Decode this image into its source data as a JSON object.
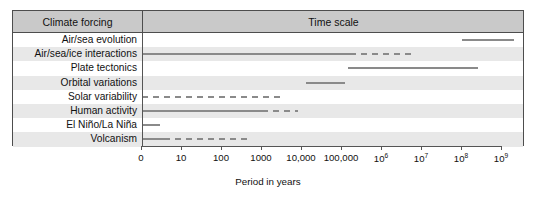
{
  "chart_data": {
    "type": "bar",
    "title": "",
    "xlabel": "Period in years",
    "ylabel": "Climate forcing",
    "xscale": "log",
    "grid": false,
    "legend": null,
    "columns": [
      "Climate forcing",
      "Time scale"
    ],
    "tick_labels": [
      "0",
      "10",
      "100",
      "1000",
      "10,000",
      "100,000",
      "10",
      "10",
      "10",
      "10"
    ],
    "tick_exponents": [
      "",
      "",
      "",
      "",
      "",
      "",
      "6",
      "7",
      "8",
      "9"
    ],
    "tick_decades": [
      0,
      1,
      2,
      3,
      4,
      5,
      6,
      7,
      8,
      9
    ],
    "categories": [
      "Air/sea evolution",
      "Air/sea/ice interactions",
      "Plate tectonics",
      "Orbital variations",
      "Solar variability",
      "Human activity",
      "El Niño/La Niña",
      "Volcanism"
    ],
    "series": [
      {
        "name": "Air/sea evolution",
        "segments": [
          {
            "start_decade": 8.0,
            "end_decade": 9.3,
            "style": "solid"
          }
        ]
      },
      {
        "name": "Air/sea/ice interactions",
        "segments": [
          {
            "start_decade": 0.0,
            "end_decade": 5.2,
            "style": "solid"
          },
          {
            "start_decade": 5.2,
            "end_decade": 6.75,
            "style": "dashed"
          }
        ]
      },
      {
        "name": "Plate tectonics",
        "segments": [
          {
            "start_decade": 5.15,
            "end_decade": 8.4,
            "style": "solid"
          }
        ]
      },
      {
        "name": "Orbital variations",
        "segments": [
          {
            "start_decade": 4.1,
            "end_decade": 5.08,
            "style": "solid"
          }
        ]
      },
      {
        "name": "Solar variability",
        "segments": [
          {
            "start_decade": 0.0,
            "end_decade": 3.58,
            "style": "dashed"
          }
        ]
      },
      {
        "name": "Human activity",
        "segments": [
          {
            "start_decade": 0.0,
            "end_decade": 3.0,
            "style": "solid"
          },
          {
            "start_decade": 3.0,
            "end_decade": 3.9,
            "style": "dashed"
          }
        ]
      },
      {
        "name": "El Niño/La Niña",
        "segments": [
          {
            "start_decade": 0.0,
            "end_decade": 0.45,
            "style": "solid"
          }
        ]
      },
      {
        "name": "Volcanism",
        "segments": [
          {
            "start_decade": 0.0,
            "end_decade": 0.55,
            "style": "solid"
          },
          {
            "start_decade": 0.55,
            "end_decade": 2.75,
            "style": "dashed"
          }
        ]
      }
    ],
    "colors": {
      "bar": "#8a8a8a",
      "header_background": "#c9c9c9",
      "row_stripe": "#e8e8e8",
      "frame": "#4d4d4d"
    }
  }
}
